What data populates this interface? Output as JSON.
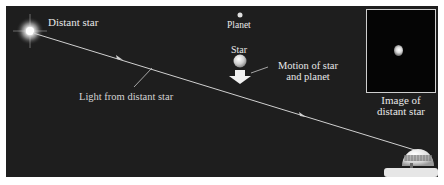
{
  "figure": {
    "labels": {
      "distant_star": "Distant star",
      "planet": "Planet",
      "star": "Star",
      "motion_line1": "Motion of star",
      "motion_line2": "and planet",
      "light": "Light from distant star",
      "image_line1": "Image of",
      "image_line2": "distant star"
    },
    "colors": {
      "background": "#1e1e1e",
      "text": "#e8e8e8",
      "light_ray": "#d0d0d0",
      "inset_border": "#cfcfcf",
      "inset_background": "#050505"
    },
    "elements": [
      "distant-star-glow",
      "light-ray-with-arrows",
      "planet-dot",
      "star-sphere",
      "motion-arrow",
      "inset-image-box",
      "telescope-dome"
    ]
  }
}
